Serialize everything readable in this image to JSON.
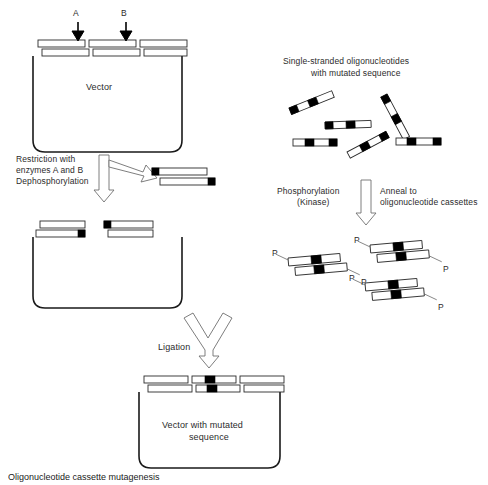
{
  "figure": {
    "title_caption": "Oligonucleotide cassette mutagenesis",
    "background": "#ffffff",
    "stroke": "#1a1a1a",
    "fill_strand": "#ffffff",
    "fill_mutation": "#000000"
  },
  "panel_top_left": {
    "name": "original-vector",
    "vector_label": "Vector",
    "site_a_label": "A",
    "site_b_label": "B"
  },
  "step_restriction": {
    "line1": "Restriction with",
    "line2": "enzymes A and B",
    "line3": "Dephosphorylation"
  },
  "panel_excised_fragment": {
    "name": "excised-fragment"
  },
  "panel_cut_vector": {
    "name": "linearized-dephosphorylated-vector"
  },
  "panel_oligos": {
    "line1": "Single-stranded oligonucleotides",
    "line2": "with mutated sequence",
    "count": 6
  },
  "step_phosphorylation": {
    "line1": "Phosphorylation",
    "line2": "(Kinase)"
  },
  "step_anneal": {
    "line1": "Anneal to",
    "line2": "oligonucleotide cassettes"
  },
  "panel_cassettes": {
    "name": "phosphorylated-annealed-cassettes",
    "phosphate_label": "P",
    "count": 3
  },
  "step_ligation": {
    "label": "Ligation"
  },
  "panel_final_vector": {
    "line1": "Vector with mutated",
    "line2": "sequence"
  }
}
